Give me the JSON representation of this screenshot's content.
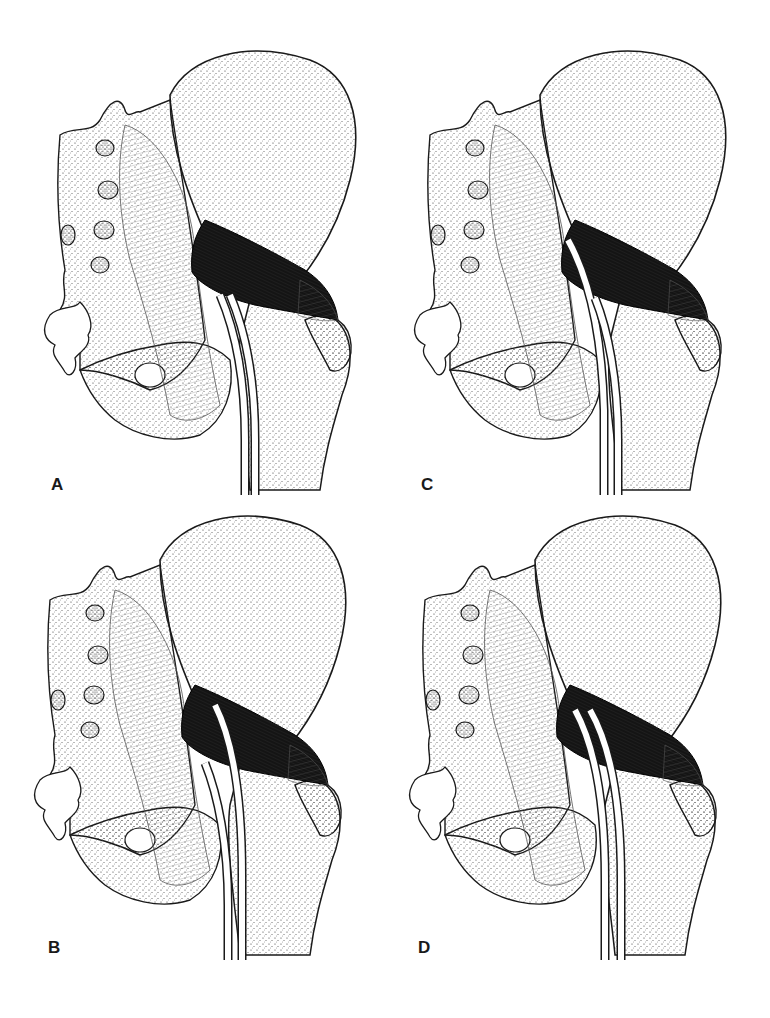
{
  "figure": {
    "panels": [
      {
        "id": "A",
        "label": "A",
        "variant": "nerve passes below piriformis"
      },
      {
        "id": "C",
        "label": "C",
        "variant": "nerve division passes through piriformis"
      },
      {
        "id": "B",
        "label": "B",
        "variant": "nerve division passes through piriformis"
      },
      {
        "id": "D",
        "label": "D",
        "variant": "two nerve divisions through and below piriformis"
      }
    ],
    "colors": {
      "ink": "#1a1a1a",
      "muscle": "#141414",
      "background": "#ffffff"
    }
  }
}
